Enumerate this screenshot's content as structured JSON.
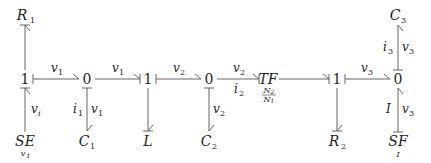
{
  "diagram": {
    "type": "bond-graph",
    "junctions": [
      {
        "id": "j1a",
        "label": "1",
        "x": 25,
        "y": 79
      },
      {
        "id": "j0a",
        "label": "0",
        "x": 87,
        "y": 79
      },
      {
        "id": "j1b",
        "label": "1",
        "x": 148,
        "y": 79
      },
      {
        "id": "j0b",
        "label": "0",
        "x": 209,
        "y": 79
      },
      {
        "id": "tf",
        "label": "TF",
        "ratio_num": "N2",
        "ratio_den": "N1",
        "x": 268,
        "y": 79
      },
      {
        "id": "j1c",
        "label": "1",
        "x": 337,
        "y": 79
      },
      {
        "id": "j0c",
        "label": "0",
        "x": 398,
        "y": 79
      }
    ],
    "elements": [
      {
        "id": "R1",
        "base": "R",
        "sub": "1",
        "x": 25,
        "y": 18
      },
      {
        "id": "SE",
        "base": "SE",
        "sub": "",
        "under": "vi",
        "x": 25,
        "y": 140
      },
      {
        "id": "C1",
        "base": "C",
        "sub": "1",
        "x": 87,
        "y": 140
      },
      {
        "id": "L",
        "base": "L",
        "sub": "",
        "x": 148,
        "y": 140
      },
      {
        "id": "C2",
        "base": "C",
        "sub": "2",
        "x": 209,
        "y": 140
      },
      {
        "id": "R2",
        "base": "R",
        "sub": "2",
        "x": 337,
        "y": 140
      },
      {
        "id": "C3",
        "base": "C",
        "sub": "3",
        "x": 398,
        "y": 18
      },
      {
        "id": "SF",
        "base": "SF",
        "sub": "",
        "under": "I",
        "x": 398,
        "y": 140
      }
    ],
    "bond_labels": [
      {
        "text": "v",
        "sub": "1",
        "x": 54,
        "y": 69
      },
      {
        "text": "v",
        "sub": "1",
        "x": 116,
        "y": 69
      },
      {
        "text": "v",
        "sub": "2",
        "x": 176,
        "y": 69
      },
      {
        "text": "v",
        "sub": "2",
        "x": 237,
        "y": 69
      },
      {
        "text": "i",
        "sub": "2",
        "x": 237,
        "y": 92
      },
      {
        "text": "v",
        "sub": "3",
        "x": 364,
        "y": 69
      },
      {
        "text": "v",
        "sub": "i",
        "x": 33,
        "y": 110
      },
      {
        "text": "i",
        "sub": "1",
        "x": 76,
        "y": 110
      },
      {
        "text": "v",
        "sub": "1",
        "x": 92,
        "y": 110
      },
      {
        "text": "v",
        "sub": "2",
        "x": 214,
        "y": 110
      },
      {
        "text": "i",
        "sub": "3",
        "x": 385,
        "y": 48
      },
      {
        "text": "v",
        "sub": "3",
        "x": 403,
        "y": 48
      },
      {
        "text": "I",
        "sub": "",
        "x": 387,
        "y": 110
      },
      {
        "text": "v",
        "sub": "3",
        "x": 403,
        "y": 110
      }
    ]
  }
}
